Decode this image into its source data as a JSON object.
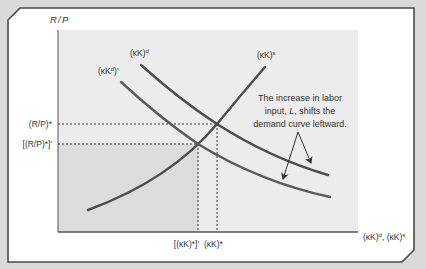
{
  "diagram": {
    "type": "economics-supply-demand-shift",
    "colors": {
      "page_background": "#d9d9d9",
      "frame_border": "#4a4a4a",
      "frame_fill": "#ffffff",
      "plot_area": "#ececec",
      "shaded_region": "#dcdcdc",
      "curve_color": "#4d4d4d",
      "axis_color": "#555555",
      "text_color": "#333333"
    },
    "axes": {
      "y_label": "R/P",
      "x_label": "(κK)^d, (κK)^s",
      "x_label_parts": {
        "a": "(κK)",
        "a_sup": "d",
        "sep": ", ",
        "b": "(κK)",
        "b_sup": "s"
      }
    },
    "curves": [
      {
        "id": "supply",
        "label": "(κK)",
        "sup": "s",
        "description": "upward sloping supply of capital services"
      },
      {
        "id": "demand",
        "label": "(κK)",
        "sup": "d",
        "description": "original demand for capital services"
      },
      {
        "id": "demand_new",
        "label": "(κK",
        "sup": "d",
        "suffix": ")'",
        "description": "new demand curve after shift"
      }
    ],
    "y_ticks": [
      {
        "id": "rp_star",
        "label": "(R/P)*"
      },
      {
        "id": "rp_star_prime",
        "label": "[(R/P)*]'"
      }
    ],
    "x_ticks": [
      {
        "id": "kk_star_prime",
        "label": "[(κK)*]'"
      },
      {
        "id": "kk_star",
        "label": "(κK)*"
      }
    ],
    "annotation": {
      "lines": [
        "The increase in labor",
        "input, L, shifts the",
        "demand curve leftward."
      ],
      "line1": "The increase in labor",
      "line2_pre": "input, ",
      "line2_var": "L",
      "line2_post": ", shifts the",
      "line3": "demand curve leftward."
    }
  }
}
